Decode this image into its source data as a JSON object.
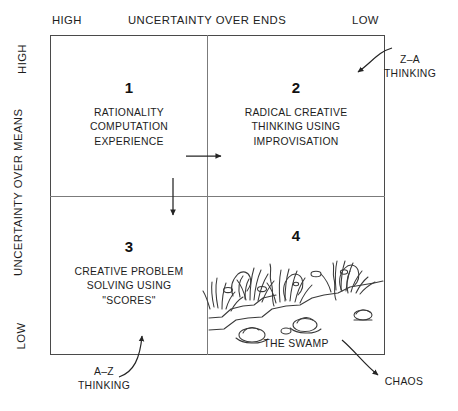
{
  "diagram": {
    "type": "2x2-matrix",
    "axes": {
      "top": {
        "title": "UNCERTAINTY OVER ENDS",
        "left_end": "HIGH",
        "right_end": "LOW"
      },
      "left": {
        "title": "UNCERTAINTY OVER MEANS",
        "top_end": "HIGH",
        "bottom_end": "LOW"
      }
    },
    "quadrants": [
      {
        "number": "1",
        "position": "top-left",
        "lines": [
          "RATIONALITY",
          "COMPUTATION",
          "EXPERIENCE"
        ]
      },
      {
        "number": "2",
        "position": "top-right",
        "lines": [
          "RADICAL CREATIVE",
          "THINKING USING",
          "IMPROVISATION"
        ]
      },
      {
        "number": "3",
        "position": "bottom-left",
        "lines": [
          "CREATIVE PROBLEM",
          "SOLVING USING",
          "\"SCORES\""
        ]
      },
      {
        "number": "4",
        "position": "bottom-right",
        "lines": [],
        "illustration": "swamp-drawing",
        "caption": "THE SWAMP"
      }
    ],
    "callouts": [
      {
        "name": "z-a-thinking",
        "lines": [
          "Z–A",
          "THINKING"
        ],
        "points_to": "quadrant-2"
      },
      {
        "name": "a-z-thinking",
        "lines": [
          "A–Z",
          "THINKING"
        ],
        "points_to": "quadrant-3"
      },
      {
        "name": "chaos",
        "lines": [
          "CHAOS"
        ],
        "points_to": "outside-bottom-right"
      }
    ],
    "internal_arrows": [
      {
        "name": "arrow-q1-to-q2",
        "direction": "right"
      },
      {
        "name": "arrow-q1-to-q3",
        "direction": "down"
      }
    ],
    "colors": {
      "frame": "#4a4a4a",
      "divider": "#7b7b7b",
      "text": "#1d1d1d",
      "ink": "#333333",
      "background": "#ffffff"
    }
  }
}
